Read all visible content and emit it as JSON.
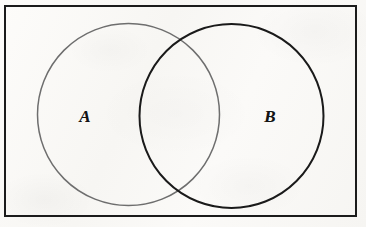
{
  "figure": {
    "background_color": "#fbfaf8",
    "width": 366,
    "height": 227
  },
  "universal_set": {
    "shape": "rectangle",
    "name": "universe-rectangle",
    "stroke_color": "#1b1b1b",
    "stroke_width": 2,
    "fill": "none",
    "x": 5,
    "y": 6,
    "width": 351,
    "height": 210
  },
  "sets": [
    {
      "id": "A",
      "label": "A",
      "shape": "circle",
      "stroke_color": "#6e6e6e",
      "stroke_width": 1.5,
      "fill": "none",
      "cx": 128.5,
      "cy": 114.5,
      "r": 91,
      "label_x": 85,
      "label_y": 116
    },
    {
      "id": "B",
      "label": "B",
      "shape": "circle",
      "stroke_color": "#1a1a1a",
      "stroke_width": 2,
      "fill": "none",
      "cx": 231.5,
      "cy": 116,
      "r": 92,
      "label_x": 270,
      "label_y": 116
    }
  ],
  "intersection": {
    "name": "a-intersect-b-region",
    "fill": "none",
    "label": ""
  },
  "chart_data": {
    "type": "diagram",
    "subtype": "venn2",
    "title": "",
    "set_labels": [
      "A",
      "B"
    ],
    "regions": [
      "A only",
      "A ∩ B",
      "B only",
      "outside (universe)"
    ],
    "shaded_regions": [],
    "values": [],
    "legend": "none",
    "grid": false
  }
}
